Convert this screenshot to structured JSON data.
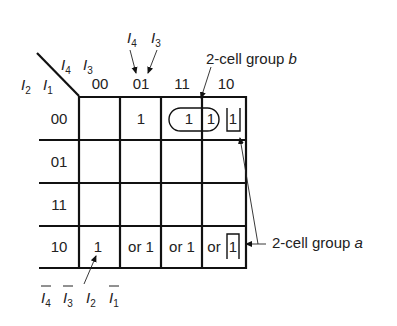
{
  "diagram": {
    "type": "karnaugh-map",
    "corner": {
      "row_vars": [
        "I2",
        "I1"
      ],
      "col_vars": [
        "I4",
        "I3"
      ]
    },
    "column_headers": [
      "00",
      "01",
      "11",
      "10"
    ],
    "row_headers": [
      "00",
      "01",
      "11",
      "10"
    ],
    "column_header_callout": [
      "I4",
      "I3"
    ],
    "cells": [
      [
        "",
        "1",
        "1",
        "1 1"
      ],
      [
        "",
        "",
        "",
        ""
      ],
      [
        "",
        "",
        "",
        ""
      ],
      [
        "1",
        "or 1",
        "or 1",
        "or 1"
      ]
    ],
    "annotations": {
      "group_b": "2-cell group b",
      "group_a": "2-cell group a",
      "minterm_label": "Ī4 Ī3 I2 Ī1"
    }
  },
  "labels": {
    "corner_I2": "I",
    "corner_I2_sub": "2",
    "corner_I1": "I",
    "corner_I1_sub": "1",
    "corner_I4": "I",
    "corner_I4_sub": "4",
    "corner_I3": "I",
    "corner_I3_sub": "3",
    "callout_I4": "I",
    "callout_I4_sub": "4",
    "callout_I3": "I",
    "callout_I3_sub": "3",
    "col0": "00",
    "col1": "01",
    "col2": "11",
    "col3": "10",
    "row0": "00",
    "row1": "01",
    "row2": "11",
    "row3": "10",
    "r0c1": "1",
    "r0c2": "1",
    "r0c3a": "1",
    "r0c3b": "1",
    "r3c0": "1",
    "r3c1": "or 1",
    "r3c2": "or 1",
    "r3c3_or": "or",
    "r3c3_1": "1",
    "group_b": "2-cell group ",
    "group_b_letter": "b",
    "group_a": "2-cell group ",
    "group_a_letter": "a",
    "m_I4": "I",
    "m_I4_sub": "4",
    "m_I3": "I",
    "m_I3_sub": "3",
    "m_I2": "I",
    "m_I2_sub": "2",
    "m_I1": "I",
    "m_I1_sub": "1"
  }
}
